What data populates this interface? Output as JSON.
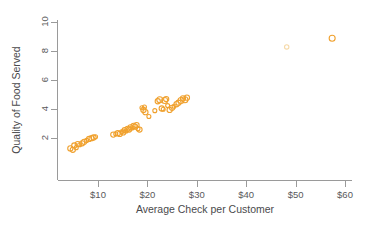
{
  "chart_data": {
    "type": "scatter",
    "title": "",
    "xlabel": "Average Check per Customer",
    "ylabel": "Quality of Food Served",
    "xlim": [
      0,
      62
    ],
    "ylim": [
      0,
      10.6
    ],
    "grid": false,
    "legend": null,
    "marker": {
      "shape": "open-circle",
      "color": "#f0a12e",
      "faint_color": "#f6d9a7"
    },
    "xticks": [
      10,
      20,
      30,
      40,
      50,
      60
    ],
    "xtick_labels": [
      "$10",
      "$20",
      "$30",
      "$40",
      "$50",
      "$60"
    ],
    "yticks": [
      2,
      4,
      6,
      8,
      10
    ],
    "ytick_labels": [
      "2",
      "4",
      "6",
      "8",
      "10"
    ],
    "points": [
      {
        "x": 4.4,
        "y": 1.25,
        "size": 2.6
      },
      {
        "x": 4.9,
        "y": 1.15,
        "size": 2.6
      },
      {
        "x": 5.2,
        "y": 1.45,
        "size": 2.6
      },
      {
        "x": 5.6,
        "y": 1.3,
        "size": 2.0
      },
      {
        "x": 5.9,
        "y": 1.55,
        "size": 2.6
      },
      {
        "x": 6.3,
        "y": 1.5,
        "size": 2.0
      },
      {
        "x": 6.8,
        "y": 1.6,
        "size": 2.6
      },
      {
        "x": 7.2,
        "y": 1.7,
        "size": 2.6
      },
      {
        "x": 7.7,
        "y": 1.8,
        "size": 2.0
      },
      {
        "x": 8.2,
        "y": 1.9,
        "size": 2.6
      },
      {
        "x": 8.7,
        "y": 1.95,
        "size": 2.6
      },
      {
        "x": 9.1,
        "y": 2.0,
        "size": 2.6
      },
      {
        "x": 9.5,
        "y": 2.05,
        "size": 2.0
      },
      {
        "x": 13.1,
        "y": 2.2,
        "size": 2.6
      },
      {
        "x": 13.6,
        "y": 2.25,
        "size": 2.0
      },
      {
        "x": 14.0,
        "y": 2.3,
        "size": 2.6
      },
      {
        "x": 14.4,
        "y": 2.25,
        "size": 2.6
      },
      {
        "x": 14.8,
        "y": 2.4,
        "size": 2.0
      },
      {
        "x": 15.1,
        "y": 2.35,
        "size": 2.6
      },
      {
        "x": 15.4,
        "y": 2.5,
        "size": 2.6
      },
      {
        "x": 15.7,
        "y": 2.45,
        "size": 2.0
      },
      {
        "x": 16.0,
        "y": 2.6,
        "size": 2.6
      },
      {
        "x": 16.3,
        "y": 2.55,
        "size": 2.6
      },
      {
        "x": 16.6,
        "y": 2.7,
        "size": 2.6
      },
      {
        "x": 16.9,
        "y": 2.65,
        "size": 2.0
      },
      {
        "x": 17.2,
        "y": 2.8,
        "size": 2.6
      },
      {
        "x": 17.5,
        "y": 2.75,
        "size": 2.6
      },
      {
        "x": 17.8,
        "y": 2.85,
        "size": 2.6
      },
      {
        "x": 18.1,
        "y": 2.6,
        "size": 2.0
      },
      {
        "x": 18.4,
        "y": 2.55,
        "size": 2.6
      },
      {
        "x": 18.9,
        "y": 4.05,
        "size": 2.0
      },
      {
        "x": 19.2,
        "y": 3.9,
        "size": 2.6
      },
      {
        "x": 19.4,
        "y": 4.1,
        "size": 2.0
      },
      {
        "x": 19.6,
        "y": 3.75,
        "size": 2.6
      },
      {
        "x": 20.3,
        "y": 3.45,
        "size": 2.0
      },
      {
        "x": 21.5,
        "y": 3.85,
        "size": 2.0
      },
      {
        "x": 22.1,
        "y": 4.5,
        "size": 2.6
      },
      {
        "x": 22.5,
        "y": 4.6,
        "size": 3.0
      },
      {
        "x": 22.9,
        "y": 4.0,
        "size": 2.6
      },
      {
        "x": 23.2,
        "y": 3.95,
        "size": 2.0
      },
      {
        "x": 23.5,
        "y": 4.55,
        "size": 3.0
      },
      {
        "x": 23.8,
        "y": 4.65,
        "size": 2.6
      },
      {
        "x": 24.1,
        "y": 4.2,
        "size": 2.0
      },
      {
        "x": 24.5,
        "y": 3.9,
        "size": 2.6
      },
      {
        "x": 25.0,
        "y": 4.05,
        "size": 2.6
      },
      {
        "x": 25.4,
        "y": 4.15,
        "size": 2.0
      },
      {
        "x": 25.9,
        "y": 4.3,
        "size": 2.6
      },
      {
        "x": 26.3,
        "y": 4.4,
        "size": 2.6
      },
      {
        "x": 26.8,
        "y": 4.55,
        "size": 3.0
      },
      {
        "x": 27.2,
        "y": 4.7,
        "size": 2.6
      },
      {
        "x": 27.6,
        "y": 4.6,
        "size": 3.0
      },
      {
        "x": 28.0,
        "y": 4.75,
        "size": 2.6
      },
      {
        "x": 48.2,
        "y": 8.25,
        "size": 2.2,
        "faint": true
      },
      {
        "x": 57.4,
        "y": 8.85,
        "size": 3.0
      }
    ],
    "outliers": [
      {
        "x": 48.2,
        "y": 8.25
      },
      {
        "x": 57.4,
        "y": 8.85
      }
    ]
  }
}
